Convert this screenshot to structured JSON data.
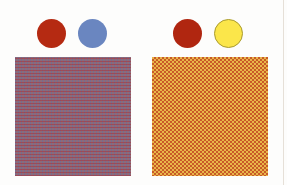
{
  "figure": {
    "left_group": {
      "swatches": [
        {
          "name": "red",
          "color": "#b52a12"
        },
        {
          "name": "blue",
          "color": "#6a86c0"
        }
      ],
      "mixture": {
        "pattern": "fine grid of red and blue dots",
        "apparent_color": "#8e6a78"
      }
    },
    "right_group": {
      "swatches": [
        {
          "name": "red",
          "color": "#b02610"
        },
        {
          "name": "yellow",
          "color": "#fbe64a",
          "outline": "#a89a30"
        }
      ],
      "mixture": {
        "pattern": "checkerboard of red and yellow dots",
        "apparent_color": "#e9b64a"
      }
    }
  }
}
